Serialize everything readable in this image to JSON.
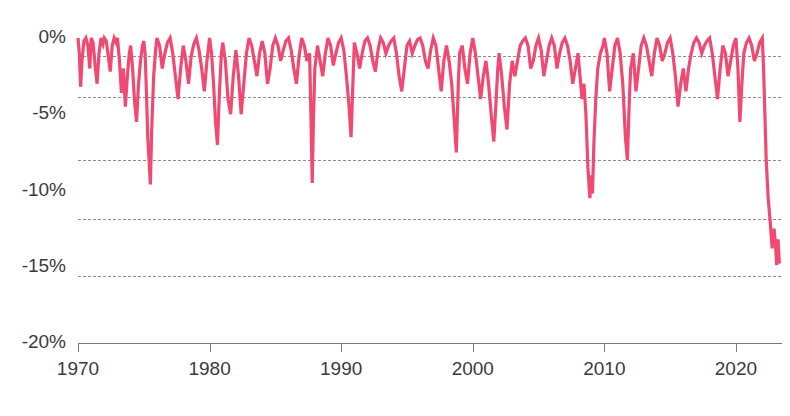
{
  "chart_data": {
    "type": "area",
    "title": "",
    "subtitle": "",
    "xlabel": "",
    "ylabel": "",
    "xlim": [
      1970,
      2023.5
    ],
    "ylim": [
      -20,
      0
    ],
    "grid": true,
    "legend_position": "none",
    "series_color": "#F04A72",
    "gridline_color": "#8d8d8d",
    "axis_color": "#7a7a7a",
    "label_color": "#3b3b3b",
    "y_ticks": [
      {
        "value": 0,
        "label": "0%"
      },
      {
        "value": -5,
        "label": "-5%"
      },
      {
        "value": -10,
        "label": "-10%"
      },
      {
        "value": -15,
        "label": "-15%"
      },
      {
        "value": -20,
        "label": "-20%"
      }
    ],
    "gridline_values": [
      -1.2,
      -3.9,
      -8.0,
      -11.9,
      -15.6,
      -20.0
    ],
    "x_ticks": [
      {
        "value": 1970,
        "label": "1970"
      },
      {
        "value": 1980,
        "label": "1980"
      },
      {
        "value": 1990,
        "label": "1990"
      },
      {
        "value": 2000,
        "label": "2000"
      },
      {
        "value": 2010,
        "label": "2010"
      },
      {
        "value": 2020,
        "label": "2020"
      }
    ],
    "series": [
      {
        "name": "Drawdown",
        "color": "#F04A72",
        "x": [
          1970.0,
          1970.1,
          1970.2,
          1970.3,
          1970.45,
          1970.6,
          1970.75,
          1970.9,
          1971.0,
          1971.15,
          1971.3,
          1971.45,
          1971.6,
          1971.75,
          1971.9,
          1972.0,
          1972.15,
          1972.3,
          1972.45,
          1972.6,
          1972.75,
          1972.9,
          1973.0,
          1973.15,
          1973.3,
          1973.45,
          1973.6,
          1973.75,
          1973.9,
          1974.0,
          1974.15,
          1974.3,
          1974.45,
          1974.6,
          1974.75,
          1974.9,
          1975.0,
          1975.1,
          1975.2,
          1975.3,
          1975.4,
          1975.5,
          1975.6,
          1975.75,
          1975.9,
          1976.0,
          1976.2,
          1976.4,
          1976.6,
          1976.8,
          1977.0,
          1977.2,
          1977.4,
          1977.6,
          1977.8,
          1978.0,
          1978.2,
          1978.4,
          1978.6,
          1978.8,
          1979.0,
          1979.2,
          1979.4,
          1979.6,
          1979.8,
          1980.0,
          1980.15,
          1980.3,
          1980.45,
          1980.6,
          1980.75,
          1980.9,
          1981.0,
          1981.2,
          1981.4,
          1981.6,
          1981.8,
          1982.0,
          1982.2,
          1982.4,
          1982.6,
          1982.8,
          1983.0,
          1983.2,
          1983.4,
          1983.6,
          1983.8,
          1984.0,
          1984.2,
          1984.4,
          1984.6,
          1984.8,
          1985.0,
          1985.2,
          1985.4,
          1985.6,
          1985.8,
          1986.0,
          1986.2,
          1986.4,
          1986.6,
          1986.8,
          1987.0,
          1987.2,
          1987.4,
          1987.6,
          1987.7,
          1987.8,
          1987.9,
          1988.0,
          1988.2,
          1988.4,
          1988.6,
          1988.8,
          1989.0,
          1989.2,
          1989.4,
          1989.6,
          1989.8,
          1990.0,
          1990.2,
          1990.4,
          1990.6,
          1990.75,
          1990.85,
          1990.95,
          1991.0,
          1991.2,
          1991.4,
          1991.6,
          1991.8,
          1992.0,
          1992.2,
          1992.4,
          1992.6,
          1992.8,
          1993.0,
          1993.2,
          1993.4,
          1993.6,
          1993.8,
          1994.0,
          1994.2,
          1994.4,
          1994.6,
          1994.8,
          1995.0,
          1995.2,
          1995.4,
          1995.6,
          1995.8,
          1996.0,
          1996.2,
          1996.4,
          1996.6,
          1996.8,
          1997.0,
          1997.2,
          1997.4,
          1997.6,
          1997.8,
          1998.0,
          1998.2,
          1998.4,
          1998.6,
          1998.75,
          1998.9,
          1999.0,
          1999.2,
          1999.4,
          1999.6,
          1999.8,
          2000.0,
          2000.2,
          2000.4,
          2000.6,
          2000.8,
          2001.0,
          2001.2,
          2001.4,
          2001.6,
          2001.75,
          2001.9,
          2002.0,
          2002.2,
          2002.4,
          2002.6,
          2002.8,
          2003.0,
          2003.2,
          2003.4,
          2003.6,
          2003.8,
          2004.0,
          2004.2,
          2004.4,
          2004.6,
          2004.8,
          2005.0,
          2005.2,
          2005.4,
          2005.6,
          2005.8,
          2006.0,
          2006.2,
          2006.4,
          2006.6,
          2006.8,
          2007.0,
          2007.2,
          2007.4,
          2007.6,
          2007.8,
          2008.0,
          2008.15,
          2008.3,
          2008.45,
          2008.6,
          2008.75,
          2008.9,
          2009.0,
          2009.1,
          2009.2,
          2009.35,
          2009.5,
          2009.7,
          2009.9,
          2010.0,
          2010.2,
          2010.4,
          2010.6,
          2010.8,
          2011.0,
          2011.2,
          2011.4,
          2011.6,
          2011.75,
          2011.9,
          2012.0,
          2012.2,
          2012.4,
          2012.6,
          2012.8,
          2013.0,
          2013.2,
          2013.4,
          2013.6,
          2013.8,
          2014.0,
          2014.2,
          2014.4,
          2014.6,
          2014.8,
          2015.0,
          2015.2,
          2015.4,
          2015.6,
          2015.8,
          2016.0,
          2016.2,
          2016.4,
          2016.6,
          2016.8,
          2017.0,
          2017.2,
          2017.4,
          2017.6,
          2017.8,
          2018.0,
          2018.2,
          2018.4,
          2018.6,
          2018.8,
          2019.0,
          2019.2,
          2019.4,
          2019.6,
          2019.8,
          2020.0,
          2020.15,
          2020.3,
          2020.45,
          2020.6,
          2020.8,
          2021.0,
          2021.2,
          2021.4,
          2021.6,
          2021.8,
          2022.0,
          2022.1,
          2022.2,
          2022.3,
          2022.45,
          2022.6,
          2022.75,
          2022.9,
          2023.0,
          2023.1,
          2023.2,
          2023.3
        ],
        "y": [
          0.0,
          -1.0,
          -3.2,
          -1.5,
          -0.2,
          0.0,
          -0.5,
          -2.0,
          0.0,
          -0.3,
          -1.8,
          -3.0,
          -1.0,
          0.0,
          -0.4,
          0.0,
          -0.2,
          -1.2,
          -2.2,
          -0.5,
          0.0,
          -0.3,
          0.0,
          -1.5,
          -3.6,
          -2.0,
          -4.5,
          -2.5,
          -1.0,
          -0.5,
          -2.0,
          -4.2,
          -5.5,
          -3.0,
          -1.5,
          -0.5,
          -0.2,
          -1.0,
          -3.5,
          -6.5,
          -8.0,
          -9.6,
          -6.0,
          -2.5,
          -0.8,
          0.0,
          -0.5,
          -2.0,
          -1.0,
          -0.3,
          0.0,
          -1.0,
          -2.5,
          -4.0,
          -2.0,
          -0.5,
          -1.5,
          -3.0,
          -1.2,
          -0.4,
          0.0,
          -0.8,
          -2.0,
          -3.5,
          -1.5,
          0.0,
          -1.0,
          -3.0,
          -5.5,
          -7.0,
          -3.5,
          -1.0,
          -0.3,
          -1.5,
          -4.0,
          -5.0,
          -2.5,
          -0.8,
          -2.5,
          -5.0,
          -3.0,
          -1.0,
          0.0,
          -0.5,
          -1.5,
          -2.5,
          -1.0,
          -0.2,
          -1.0,
          -3.0,
          -2.0,
          -0.5,
          0.0,
          -0.5,
          -1.5,
          -0.8,
          -0.2,
          0.0,
          -0.8,
          -2.0,
          -3.0,
          -1.2,
          0.0,
          -0.5,
          -1.5,
          -1.0,
          -5.0,
          -9.5,
          -5.0,
          -2.0,
          -0.5,
          -1.5,
          -2.5,
          -1.0,
          0.0,
          -0.5,
          -1.8,
          -1.0,
          -0.3,
          0.0,
          -0.8,
          -2.5,
          -4.5,
          -6.5,
          -4.0,
          -1.5,
          -0.3,
          -1.0,
          -2.0,
          -1.0,
          -0.2,
          0.0,
          -0.5,
          -1.5,
          -2.2,
          -0.8,
          0.0,
          -0.3,
          -1.0,
          -0.5,
          -0.2,
          0.0,
          -1.0,
          -2.5,
          -3.5,
          -2.0,
          -0.5,
          -0.2,
          -1.0,
          -0.5,
          -0.1,
          0.0,
          -0.5,
          -1.5,
          -2.0,
          -0.8,
          0.0,
          -0.5,
          -2.0,
          -3.5,
          -1.5,
          -0.5,
          -1.5,
          -3.0,
          -5.5,
          -7.5,
          -3.0,
          -1.0,
          -0.5,
          -2.0,
          -3.0,
          -1.0,
          0.0,
          -1.0,
          -2.5,
          -4.0,
          -2.5,
          -1.5,
          -3.0,
          -5.0,
          -6.8,
          -4.5,
          -2.0,
          -1.0,
          -2.5,
          -4.5,
          -6.0,
          -3.0,
          -1.5,
          -2.5,
          -1.5,
          -0.5,
          -0.2,
          0.0,
          -0.5,
          -2.0,
          -1.5,
          -0.5,
          0.0,
          -0.8,
          -2.5,
          -1.5,
          -0.5,
          0.0,
          -0.5,
          -2.0,
          -1.0,
          -0.3,
          0.0,
          -0.5,
          -1.5,
          -3.0,
          -2.0,
          -1.0,
          -2.5,
          -4.0,
          -3.0,
          -5.0,
          -8.5,
          -10.5,
          -9.0,
          -10.2,
          -7.0,
          -4.0,
          -2.0,
          -1.0,
          -0.5,
          0.0,
          -1.0,
          -3.5,
          -2.0,
          -0.5,
          0.0,
          -1.0,
          -3.0,
          -6.5,
          -8.0,
          -4.0,
          -2.0,
          -1.0,
          -3.5,
          -2.0,
          -0.5,
          0.0,
          -0.5,
          -1.5,
          -2.5,
          -1.0,
          0.0,
          -0.5,
          -1.5,
          -1.0,
          -0.3,
          0.0,
          -1.0,
          -2.5,
          -4.5,
          -3.0,
          -2.0,
          -3.5,
          -2.0,
          -1.0,
          -0.3,
          0.0,
          -0.3,
          -1.0,
          -0.5,
          -0.2,
          0.0,
          -1.0,
          -2.5,
          -4.0,
          -2.0,
          -0.5,
          -1.0,
          -2.5,
          -1.5,
          -0.5,
          0.0,
          -2.0,
          -5.5,
          -3.0,
          -1.0,
          -0.3,
          0.0,
          -0.5,
          -1.5,
          -1.0,
          -0.3,
          0.0,
          -2.0,
          -5.0,
          -8.0,
          -10.5,
          -12.0,
          -13.8,
          -12.5,
          -13.5,
          -14.9,
          -13.2,
          -14.8
        ]
      }
    ]
  },
  "axes": {
    "y_axis_name": "drawdown-percent-axis",
    "x_axis_name": "year-axis"
  }
}
